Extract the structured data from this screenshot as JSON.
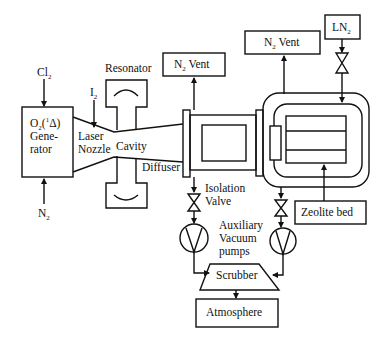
{
  "diagram": {
    "type": "process-flow schematic (chemical oxygen-iodine laser with vacuum/scrubber system)",
    "nodes": {
      "cl2_input": {
        "label": "Cl",
        "sub": "2"
      },
      "n2_input": {
        "label": "N",
        "sub": "2"
      },
      "i2_input": {
        "label": "I",
        "sub": "2"
      },
      "generator": {
        "line1_pre": "O",
        "line1_sub": "2",
        "line1_mid": "(",
        "line1_sup": "1",
        "line1_post": "Δ)",
        "line2": "Gene-",
        "line3": "rator"
      },
      "nozzle": {
        "line1": "Laser",
        "line2": "Nozzle"
      },
      "cavity": {
        "label": "Cavity"
      },
      "resonator": {
        "label": "Resonator"
      },
      "diffuser": {
        "label": "Diffuser"
      },
      "n2_vent_left": {
        "label_pre": "N",
        "label_sub": "2",
        "label_post": " Vent"
      },
      "n2_vent_right": {
        "label_pre": "N",
        "label_sub": "2",
        "label_post": " Vent"
      },
      "ln2": {
        "label_pre": "LN",
        "label_sub": "2"
      },
      "isolation_valve": {
        "line1": "Isolation",
        "line2": "Valve"
      },
      "aux_pumps": {
        "line1": "Auxiliary",
        "line2": "Vacuum",
        "line3": "pumps"
      },
      "zeolite_bed": {
        "label": "Zeolite bed"
      },
      "scrubber": {
        "label": "Scrubber"
      },
      "atmosphere": {
        "label": "Atmosphere"
      }
    },
    "edges": [
      {
        "from": "Cl2",
        "to": "O2(1Δ) Generator"
      },
      {
        "from": "N2",
        "to": "O2(1Δ) Generator"
      },
      {
        "from": "I2",
        "to": "Laser Nozzle"
      },
      {
        "from": "O2(1Δ) Generator",
        "to": "Laser Nozzle"
      },
      {
        "from": "Laser Nozzle",
        "to": "Cavity"
      },
      {
        "from": "Cavity",
        "to": "Diffuser"
      },
      {
        "from": "Diffuser",
        "to": "N2 Vent (left)"
      },
      {
        "from": "Diffuser",
        "to": "Isolation Valve"
      },
      {
        "from": "Isolation Valve",
        "to": "Auxiliary Vacuum pump (left)"
      },
      {
        "from": "Cryo chamber",
        "to": "N2 Vent (right)"
      },
      {
        "from": "LN2",
        "to": "Cryo chamber",
        "via": "valve"
      },
      {
        "from": "Zeolite bed",
        "to": "Cryo chamber"
      },
      {
        "from": "Cryo chamber",
        "to": "Auxiliary Vacuum pump (right)",
        "via": "valve"
      },
      {
        "from": "Auxiliary Vacuum pump (left)",
        "to": "Scrubber"
      },
      {
        "from": "Auxiliary Vacuum pump (right)",
        "to": "Scrubber"
      },
      {
        "from": "Scrubber",
        "to": "Atmosphere"
      }
    ]
  }
}
